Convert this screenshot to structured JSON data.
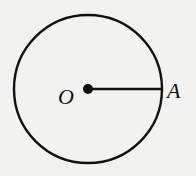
{
  "diagram": {
    "type": "circle-with-radius",
    "center": {
      "x": 88,
      "y": 89
    },
    "radius": 74,
    "stroke_color": "#111111",
    "background": "#f2f2f0",
    "points": [
      {
        "id": "O",
        "label": "O",
        "x": 88,
        "y": 89,
        "label_x": 58,
        "label_y": 104,
        "marked": true
      },
      {
        "id": "A",
        "label": "A",
        "x": 162,
        "y": 89,
        "label_x": 167,
        "label_y": 98,
        "marked": false
      }
    ],
    "segments": [
      {
        "from": "O",
        "to": "A",
        "name": "radius-OA"
      }
    ]
  }
}
